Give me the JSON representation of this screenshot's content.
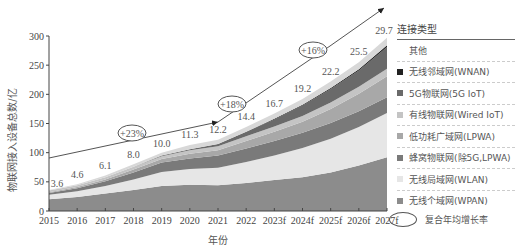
{
  "chart_data": {
    "type": "area",
    "stacked": true,
    "xlabel": "年份",
    "ylabel": "物联网接入设备总数/亿",
    "ylim": [
      0,
      300
    ],
    "yticks": [
      0,
      50,
      100,
      150,
      200,
      250,
      300
    ],
    "categories": [
      "2015",
      "2016",
      "2017",
      "2018",
      "2019",
      "2020",
      "2021",
      "2022",
      "2023f",
      "2024f",
      "2025f",
      "2026f",
      "2027f"
    ],
    "total_labels": [
      "3.6",
      "4.6",
      "6.1",
      "8.0",
      "10.0",
      "11.3",
      "12.2",
      "14.4",
      "16.7",
      "19.2",
      "22.2",
      "25.5",
      "29.7"
    ],
    "totals": [
      36,
      46,
      61,
      80,
      100,
      113,
      122,
      144,
      167,
      192,
      222,
      255,
      297
    ],
    "series": [
      {
        "name": "无线个域网(WPAN)",
        "color": "#8c8c8c",
        "values": [
          20,
          24,
          30,
          36,
          43,
          45,
          44,
          48,
          53,
          58,
          66,
          78,
          92
        ]
      },
      {
        "name": "无线局域网(WLAN)",
        "color": "#e6e6e6",
        "values": [
          8,
          10,
          13,
          18,
          24,
          27,
          30,
          36,
          42,
          50,
          58,
          66,
          76
        ]
      },
      {
        "name": "蜂窝物联网(除5G,LPWA)",
        "color": "#7a7a7a",
        "values": [
          3,
          5,
          8,
          12,
          16,
          18,
          21,
          23,
          25,
          26,
          27,
          27,
          27
        ]
      },
      {
        "name": "低功耗广域网(LPWA)",
        "color": "#a8a8a8",
        "values": [
          1,
          2,
          3,
          5,
          6,
          8,
          9,
          13,
          16,
          19,
          24,
          30,
          36
        ]
      },
      {
        "name": "有线物联网(Wired IoT)",
        "color": "#c4c4c4",
        "values": [
          3,
          3,
          4,
          5,
          5,
          6,
          7,
          8,
          9,
          10,
          11,
          12,
          13
        ]
      },
      {
        "name": "5G物联网(5G IoT)",
        "color": "#6a6a6a",
        "values": [
          0,
          0,
          0,
          0,
          1,
          2,
          4,
          8,
          12,
          18,
          23,
          28,
          37
        ]
      },
      {
        "name": "无线邻域网(WNAN)",
        "color": "#222222",
        "values": [
          0,
          0,
          0,
          0,
          0,
          0,
          0,
          0,
          1,
          1,
          2,
          2,
          3
        ]
      },
      {
        "name": "其他",
        "color": "#d8d8d8",
        "values": [
          1,
          2,
          3,
          4,
          5,
          7,
          7,
          8,
          9,
          10,
          11,
          12,
          13
        ]
      }
    ],
    "cagr_annotations": [
      {
        "label": "+23%",
        "period": "2015–2021"
      },
      {
        "label": "+18%",
        "period": "2021–2024f"
      },
      {
        "label": "+16%",
        "period": "2024f–2027f"
      }
    ],
    "legend_position": "right"
  },
  "legend": {
    "title": "连接类型",
    "items": [
      {
        "label": "其他",
        "color": "#ffffff"
      },
      {
        "label": "无线邻域网(WNAN)",
        "color": "#222222"
      },
      {
        "label": "5G物联网(5G IoT)",
        "color": "#6a6a6a"
      },
      {
        "label": "有线物联网(Wired IoT)",
        "color": "#c4c4c4"
      },
      {
        "label": "低功耗广域网(LPWA)",
        "color": "#a8a8a8"
      },
      {
        "label": "蜂窝物联网(除5G,LPWA)",
        "color": "#7a7a7a"
      },
      {
        "label": "无线局域网(WLAN)",
        "color": "#e6e6e6"
      },
      {
        "label": "无线个域网(WPAN)",
        "color": "#8c8c8c"
      }
    ],
    "cagr_label": "复合年均增长率"
  }
}
